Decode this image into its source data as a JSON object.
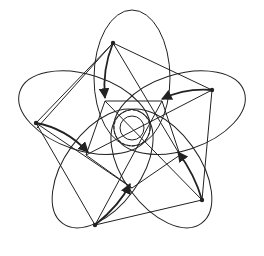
{
  "diagram": {
    "colors": {
      "stroke": "#222222",
      "background": "#ffffff"
    },
    "outer_vertices": [
      [
        113,
        43
      ],
      [
        212,
        90
      ],
      [
        202,
        200
      ],
      [
        95,
        225
      ],
      [
        36,
        123
      ]
    ],
    "inner_vertices": [
      [
        105,
        95
      ],
      [
        162,
        98
      ],
      [
        178,
        155
      ],
      [
        131,
        186
      ],
      [
        88,
        152
      ]
    ],
    "center": [
      132,
      128
    ]
  }
}
